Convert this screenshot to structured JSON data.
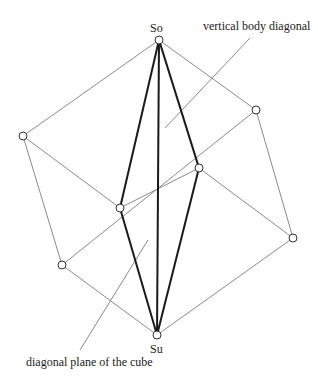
{
  "labels": {
    "top_vertex": "So",
    "bottom_vertex": "Su",
    "vertical_diagonal": "vertical body diagonal",
    "diagonal_plane": "diagonal plane of the cube"
  },
  "colors": {
    "thin_edge": "#8a8a8a",
    "bold_edge": "#1a1a1a",
    "vertex_fill": "#ffffff"
  }
}
